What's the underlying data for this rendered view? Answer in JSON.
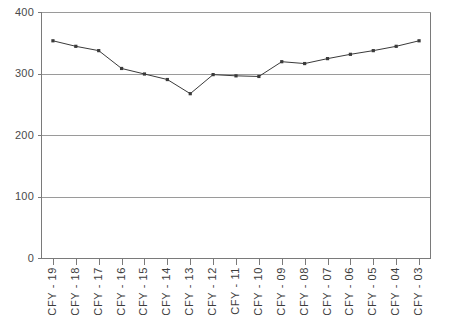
{
  "chart_data": {
    "type": "line",
    "title": "",
    "xlabel": "",
    "ylabel": "",
    "ylim": [
      0,
      400
    ],
    "yticks": [
      0,
      100,
      200,
      300,
      400
    ],
    "grid": true,
    "legend": "none",
    "marker": "square",
    "line_color": "#3a3a3a",
    "grid_color": "#9a9a9a",
    "axis_color": "#7a7a7a",
    "categories": [
      "CFY - 19",
      "CFY - 18",
      "CFY - 17",
      "CFY - 16",
      "CFY - 15",
      "CFY - 14",
      "CFY - 13",
      "CFY - 12",
      "CFY - 11",
      "CFY - 10",
      "CFY - 09",
      "CFY - 08",
      "CFY - 07",
      "CFY - 06",
      "CFY - 05",
      "CFY - 04",
      "CFY - 03"
    ],
    "values": [
      354,
      345,
      338,
      309,
      300,
      291,
      268,
      299,
      297,
      296,
      320,
      317,
      325,
      332,
      338,
      345,
      354
    ]
  }
}
